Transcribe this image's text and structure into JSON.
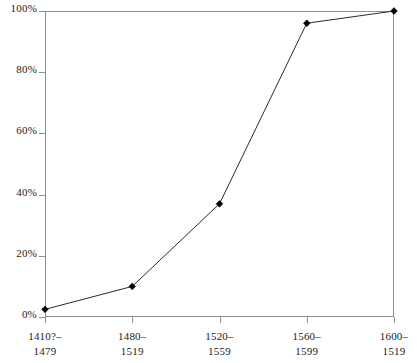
{
  "chart_data": {
    "type": "line",
    "title": "",
    "xlabel": "",
    "ylabel": "",
    "categories": [
      "1410?–\n1479",
      "1480–\n1519",
      "1520–\n1559",
      "1560–\n1599",
      "1600–\n1519"
    ],
    "category_lines": [
      {
        "line1": "1410?–",
        "line2": "1479"
      },
      {
        "line1": "1480–",
        "line2": "1519"
      },
      {
        "line1": "1520–",
        "line2": "1559"
      },
      {
        "line1": "1560–",
        "line2": "1599"
      },
      {
        "line1": "1600–",
        "line2": "1519"
      }
    ],
    "values": [
      2.5,
      10,
      37,
      96,
      100
    ],
    "ylim": [
      0,
      100
    ],
    "yticks": [
      0,
      20,
      40,
      60,
      80,
      100
    ],
    "ytick_labels": [
      "0%",
      "20%",
      "40%",
      "60%",
      "80%",
      "100%"
    ],
    "grid": false,
    "legend": null,
    "marker": "diamond",
    "line_color": "#2b2b2b",
    "marker_color": "#000000",
    "axis_color": "#8f8f8f",
    "background": "#ffffff"
  }
}
